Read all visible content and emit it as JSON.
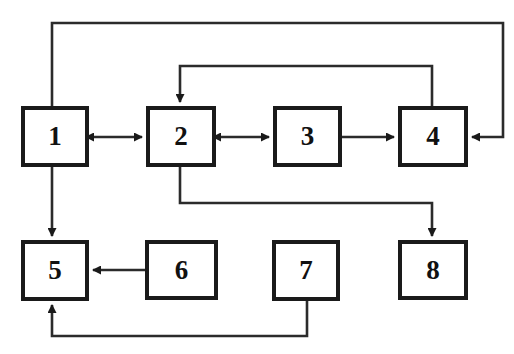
{
  "diagram": {
    "canvas": {
      "width": 514,
      "height": 354
    },
    "colors": {
      "background": "#ffffff",
      "stroke": "#1a1a1a",
      "line": "#2b2b2b",
      "label": "#111111"
    },
    "nodes": [
      {
        "id": "1",
        "label": "1",
        "x": 21,
        "y": 106,
        "w": 68,
        "h": 61
      },
      {
        "id": "2",
        "label": "2",
        "x": 146,
        "y": 106,
        "w": 70,
        "h": 61
      },
      {
        "id": "3",
        "label": "3",
        "x": 273,
        "y": 106,
        "w": 69,
        "h": 61
      },
      {
        "id": "4",
        "label": "4",
        "x": 398,
        "y": 106,
        "w": 70,
        "h": 61
      },
      {
        "id": "5",
        "label": "5",
        "x": 21,
        "y": 240,
        "w": 68,
        "h": 61
      },
      {
        "id": "6",
        "label": "6",
        "x": 145,
        "y": 240,
        "w": 73,
        "h": 60
      },
      {
        "id": "7",
        "label": "7",
        "x": 272,
        "y": 240,
        "w": 68,
        "h": 61
      },
      {
        "id": "8",
        "label": "8",
        "x": 398,
        "y": 240,
        "w": 70,
        "h": 60
      }
    ],
    "edges": [
      {
        "id": "e-1-2",
        "from": "1",
        "to": "2",
        "kind": "bidirectional",
        "path": "M 93 137 L 142 137"
      },
      {
        "id": "e-2-3",
        "from": "2",
        "to": "3",
        "kind": "bidirectional",
        "path": "M 220 137 L 269 137"
      },
      {
        "id": "e-3-4",
        "from": "3",
        "to": "4",
        "kind": "directed",
        "path": "M 342 137 L 394 137"
      },
      {
        "id": "e-4-2",
        "from": "4",
        "to": "2",
        "kind": "directed",
        "path": "M 432 106 L 432 66 L 180 66 L 180 102"
      },
      {
        "id": "e-top-4",
        "from": "1",
        "to": "4",
        "kind": "directed",
        "path": "M 52 106 L 52 23 L 503 23 L 503 137 L 472 137"
      },
      {
        "id": "e-1-5",
        "from": "1",
        "to": "5",
        "kind": "directed",
        "path": "M 52 167 L 52 236"
      },
      {
        "id": "e-2-8",
        "from": "2",
        "to": "8",
        "kind": "directed",
        "path": "M 180 167 L 180 203 L 432 203 L 432 236"
      },
      {
        "id": "e-6-5",
        "from": "6",
        "to": "5",
        "kind": "directed",
        "path": "M 145 270 L 93 270"
      },
      {
        "id": "e-7-5",
        "from": "7",
        "to": "5",
        "kind": "directed",
        "path": "M 307 301 L 307 336 L 52 336 L 52 305"
      }
    ]
  }
}
